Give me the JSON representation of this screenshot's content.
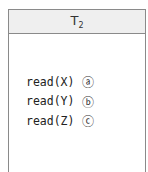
{
  "transaction": {
    "name_base": "T",
    "name_sub": "2",
    "operations": [
      {
        "code": "read(X)",
        "mark": "ⓐ"
      },
      {
        "code": "read(Y)",
        "mark": "ⓑ"
      },
      {
        "code": "read(Z)",
        "mark": "ⓒ"
      }
    ]
  }
}
